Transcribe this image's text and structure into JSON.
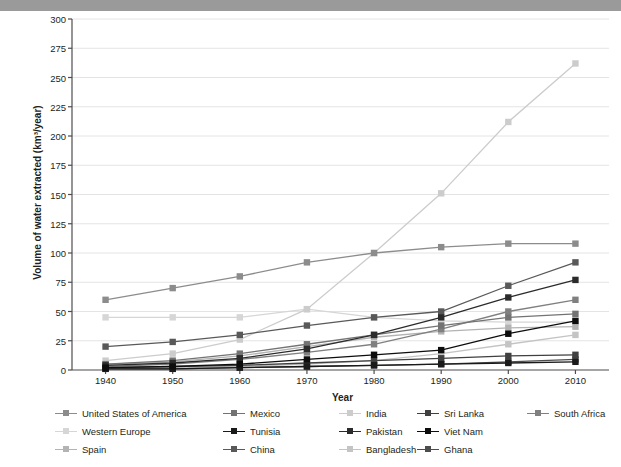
{
  "topbar": {
    "text": ""
  },
  "chart_data": {
    "type": "line",
    "title": "",
    "xlabel": "Year",
    "ylabel": "Volume of water extracted (km³/year)",
    "x": [
      1940,
      1950,
      1960,
      1970,
      1980,
      1990,
      2000,
      2010
    ],
    "xtick_labels": [
      "1940",
      "1950",
      "1960",
      "1970",
      "1980",
      "1990",
      "2000",
      "2010"
    ],
    "ytick_labels": [
      "0",
      "25",
      "50",
      "75",
      "100",
      "125",
      "150",
      "175",
      "200",
      "225",
      "250",
      "275",
      "300"
    ],
    "yticks": [
      0,
      25,
      50,
      75,
      100,
      125,
      150,
      175,
      200,
      225,
      250,
      275,
      300
    ],
    "ylim": [
      0,
      300
    ],
    "xlim": [
      1935,
      2015
    ],
    "grid": "horizontal",
    "legend_position": "bottom",
    "marker": "square",
    "series": [
      {
        "name": "United States of America",
        "color": "#8c8c8c",
        "values": [
          60,
          70,
          80,
          92,
          100,
          105,
          108,
          108
        ]
      },
      {
        "name": "Western Europe",
        "color": "#d6d6d6",
        "values": [
          45,
          45,
          45,
          52,
          45,
          42,
          41,
          41
        ]
      },
      {
        "name": "Spain",
        "color": "#b3b3b3",
        "values": [
          5,
          7,
          12,
          20,
          28,
          33,
          36,
          37
        ]
      },
      {
        "name": "Mexico",
        "color": "#737373",
        "values": [
          5,
          8,
          14,
          22,
          30,
          38,
          45,
          48
        ]
      },
      {
        "name": "Tunisia",
        "color": "#1a1a1a",
        "values": [
          1,
          1,
          2,
          3,
          4,
          5,
          6,
          7
        ]
      },
      {
        "name": "China",
        "color": "#595959",
        "values": [
          20,
          24,
          30,
          38,
          45,
          50,
          72,
          92
        ]
      },
      {
        "name": "India",
        "color": "#cccccc",
        "values": [
          8,
          14,
          26,
          52,
          100,
          151,
          212,
          262
        ]
      },
      {
        "name": "Pakistan",
        "color": "#2b2b2b",
        "values": [
          4,
          6,
          10,
          18,
          30,
          45,
          62,
          77
        ]
      },
      {
        "name": "Bangladesh",
        "color": "#c4c4c4",
        "values": [
          1,
          2,
          3,
          5,
          8,
          14,
          22,
          30
        ]
      },
      {
        "name": "Sri Lanka",
        "color": "#404040",
        "values": [
          2,
          3,
          4,
          6,
          8,
          10,
          12,
          13
        ]
      },
      {
        "name": "Viet Nam",
        "color": "#0d0d0d",
        "values": [
          2,
          3,
          5,
          9,
          13,
          17,
          31,
          42
        ]
      },
      {
        "name": "Ghana",
        "color": "#4d4d4d",
        "values": [
          1,
          1,
          2,
          3,
          4,
          5,
          7,
          9
        ]
      },
      {
        "name": "South Africa",
        "color": "#808080",
        "values": [
          3,
          5,
          9,
          15,
          22,
          35,
          50,
          60
        ]
      }
    ]
  },
  "legend": {
    "items": [
      {
        "label": "United States of America",
        "color": "#8c8c8c"
      },
      {
        "label": "Western Europe",
        "color": "#d6d6d6"
      },
      {
        "label": "Spain",
        "color": "#b3b3b3"
      },
      {
        "label": "Mexico",
        "color": "#737373"
      },
      {
        "label": "Tunisia",
        "color": "#1a1a1a"
      },
      {
        "label": "China",
        "color": "#595959"
      },
      {
        "label": "India",
        "color": "#cccccc"
      },
      {
        "label": "Pakistan",
        "color": "#2b2b2b"
      },
      {
        "label": "Bangladesh",
        "color": "#c4c4c4"
      },
      {
        "label": "Sri Lanka",
        "color": "#404040"
      },
      {
        "label": "Viet Nam",
        "color": "#0d0d0d"
      },
      {
        "label": "Ghana",
        "color": "#4d4d4d"
      },
      {
        "label": "South Africa",
        "color": "#808080"
      }
    ]
  }
}
